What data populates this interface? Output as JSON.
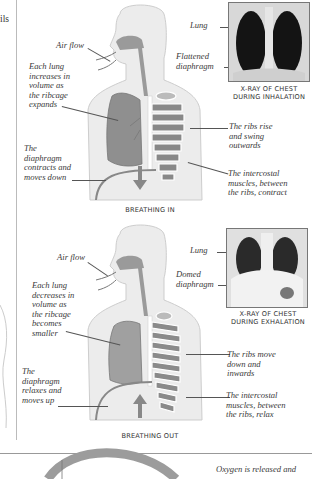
{
  "page": {
    "left_margin_fragment": [
      "",
      "ils"
    ]
  },
  "breathing_in": {
    "caption": "BREATHING IN",
    "labels": {
      "air_flow": "Air flow",
      "lung_volume": [
        "Each lung",
        "increases in",
        "volume as",
        "the ribcage",
        "expands"
      ],
      "diaphragm": [
        "The",
        "diaphragm",
        "contracts and",
        "moves down"
      ],
      "ribs": [
        "The ribs rise",
        "and swing",
        "outwards"
      ],
      "intercostal": [
        "The intercostal",
        "muscles, between",
        "the ribs, contract"
      ]
    },
    "xray": {
      "caption": [
        "X-RAY OF CHEST",
        "DURING INHALATION"
      ],
      "lung_label": "Lung",
      "diaphragm_label": [
        "Flattened",
        "diaphragm"
      ]
    }
  },
  "breathing_out": {
    "caption": "BREATHING OUT",
    "labels": {
      "air_flow": "Air flow",
      "lung_volume": [
        "Each lung",
        "decreases in",
        "volume as",
        "the ribcage",
        "becomes",
        "smaller"
      ],
      "diaphragm": [
        "The",
        "diaphragm",
        "relaxes and",
        "moves up"
      ],
      "ribs": [
        "The ribs move",
        "down and",
        "inwards"
      ],
      "intercostal": [
        "The intercostal",
        "muscles, between",
        "the ribs, relax"
      ]
    },
    "xray": {
      "caption": [
        "X-RAY OF CHEST",
        "DURING EXHALATION"
      ],
      "lung_label": "Lung",
      "diaphragm_label": [
        "Domed",
        "diaphragm"
      ]
    }
  },
  "footer": {
    "oxygen_text": "Oxygen is released and"
  },
  "colors": {
    "body_fill": "#ededed",
    "body_outline": "#cfcfcf",
    "organ": "#9a9a9a",
    "organ_dark": "#7d7d7d",
    "arrow": "#888888",
    "ring": "#9c9c9c"
  }
}
